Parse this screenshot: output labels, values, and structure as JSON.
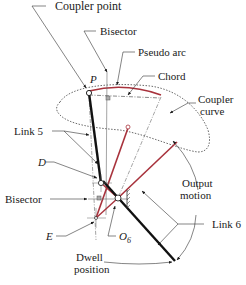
{
  "diagram": {
    "type": "linkage-mechanism",
    "colors": {
      "ink": "#1a1a1a",
      "red_link": "#a8323c",
      "construction": "#555555",
      "background": "#ffffff"
    },
    "labels": {
      "coupler_point": "Coupler point",
      "bisector_top": "Bisector",
      "pseudo_arc": "Pseudo arc",
      "chord": "Chord",
      "coupler_curve_line1": "Coupler",
      "coupler_curve_line2": "curve",
      "link5": "Link 5",
      "point_d": "D",
      "point_p": "P",
      "bisector_left": "Bisector",
      "point_e": "E",
      "point_o": "O",
      "point_o_sub": "6",
      "output_motion_line1": "Output",
      "output_motion_line2": "motion",
      "link6": "Link 6",
      "dwell_line1": "Dwell",
      "dwell_line2": "position"
    }
  }
}
